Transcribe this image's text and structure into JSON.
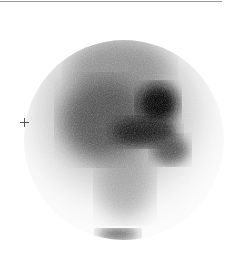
{
  "image": {
    "type": "scintigraphy",
    "description": "Circular gamma-camera field of view showing radiotracer uptake",
    "marker_glyph": "+",
    "colors": {
      "background": "#ffffff",
      "uptake_dark": "#1a1a1a",
      "uptake_mid": "#5a5a5a",
      "rule": "#9a9a9a"
    }
  }
}
